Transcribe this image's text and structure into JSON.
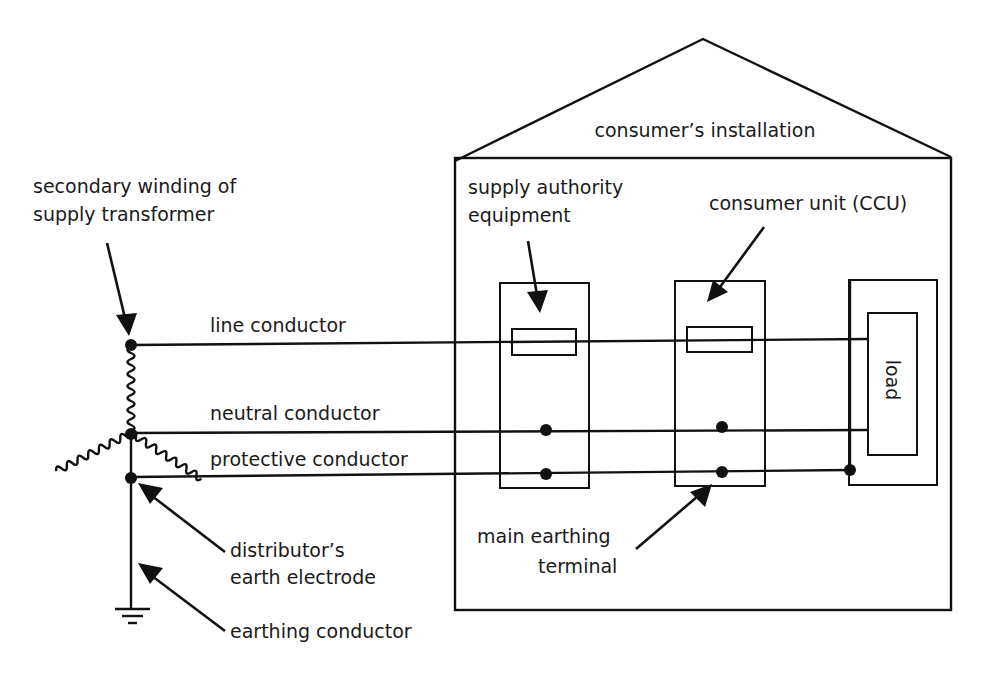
{
  "diagram": {
    "colors": {
      "line": "#111111",
      "background": "#ffffff",
      "text": "#1a1a1a"
    },
    "labels": {
      "secondary_winding_1": "secondary winding of",
      "secondary_winding_2": "supply transformer",
      "line_conductor": "line conductor",
      "neutral_conductor": "neutral conductor",
      "protective_conductor": "protective conductor",
      "distributor_1": "distributor’s",
      "distributor_2": "earth electrode",
      "earthing_conductor": "earthing conductor",
      "consumers_installation": "consumer’s installation",
      "supply_authority_1": "supply authority",
      "supply_authority_2": "equipment",
      "consumer_unit": "consumer unit (CCU)",
      "load": "load",
      "main_earthing_1": "main earthing",
      "main_earthing_2": "terminal"
    },
    "components": [
      {
        "name": "supply transformer secondary winding (star)",
        "icon": "coil-icon"
      },
      {
        "name": "supply authority equipment",
        "contains": [
          "fuse",
          "neutral terminal",
          "earth terminal"
        ]
      },
      {
        "name": "consumer unit (CCU)",
        "contains": [
          "fuse",
          "neutral terminal",
          "main earthing terminal"
        ]
      },
      {
        "name": "load enclosure",
        "contains": [
          "load"
        ]
      },
      {
        "name": "earth electrode",
        "icon": "ground-icon"
      }
    ]
  }
}
